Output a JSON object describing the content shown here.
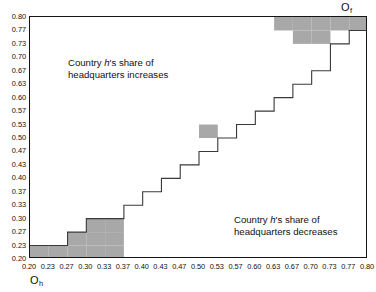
{
  "figure": {
    "origin_h_label": "O",
    "origin_h_sub": "h",
    "origin_f_label": "O",
    "origin_f_sub": "f"
  },
  "annotations": {
    "upper_left_line1_prefix": "Country ",
    "upper_left_italic": "h",
    "upper_left_line1_suffix": "'s share of",
    "upper_left_line2": "headquarters increases",
    "lower_right_line1_prefix": "Country ",
    "lower_right_italic": "h",
    "lower_right_line1_suffix": "'s share of",
    "lower_right_line2": "headquarters decreases"
  },
  "chart_data": {
    "type": "area",
    "title": "",
    "xlabel": "O_h",
    "ylabel": "O_f",
    "xlim": [
      0.2,
      0.8
    ],
    "ylim": [
      0.2,
      0.8
    ],
    "grid": false,
    "legend": false,
    "xticklabels": [
      "0.20",
      "0.23",
      "0.27",
      "0.30",
      "0.33",
      "0.37",
      "0.40",
      "0.43",
      "0.47",
      "0.50",
      "0.53",
      "0.57",
      "0.60",
      "0.63",
      "0.67",
      "0.70",
      "0.73",
      "0.77",
      "0.80"
    ],
    "yticklabels": [
      "0.20",
      "0.23",
      "0.27",
      "0.30",
      "0.33",
      "0.37",
      "0.40",
      "0.43",
      "0.47",
      "0.50",
      "0.53",
      "0.57",
      "0.60",
      "0.63",
      "0.67",
      "0.70",
      "0.73",
      "0.77",
      "0.80"
    ],
    "n_cells": 18,
    "staircase_top_of_column": [
      1,
      1,
      2,
      3,
      3,
      4,
      5,
      6,
      7,
      8,
      9,
      10,
      11,
      12,
      13,
      14,
      16,
      17,
      18
    ],
    "shaded_cells": [
      {
        "col": 0,
        "row": 0
      },
      {
        "col": 1,
        "row": 0
      },
      {
        "col": 2,
        "row": 0
      },
      {
        "col": 2,
        "row": 1
      },
      {
        "col": 3,
        "row": 0
      },
      {
        "col": 3,
        "row": 1
      },
      {
        "col": 3,
        "row": 2
      },
      {
        "col": 4,
        "row": 0
      },
      {
        "col": 4,
        "row": 1
      },
      {
        "col": 4,
        "row": 2
      },
      {
        "col": 9,
        "row": 9
      },
      {
        "col": 13,
        "row": 17
      },
      {
        "col": 14,
        "row": 16
      },
      {
        "col": 14,
        "row": 17
      },
      {
        "col": 15,
        "row": 16
      },
      {
        "col": 15,
        "row": 17
      },
      {
        "col": 16,
        "row": 17
      },
      {
        "col": 17,
        "row": 17
      }
    ],
    "colors": {
      "shade_fill": "#a8a8a8",
      "line": "#3a3a3a",
      "frame": "#141414",
      "background": "#ffffff"
    }
  }
}
